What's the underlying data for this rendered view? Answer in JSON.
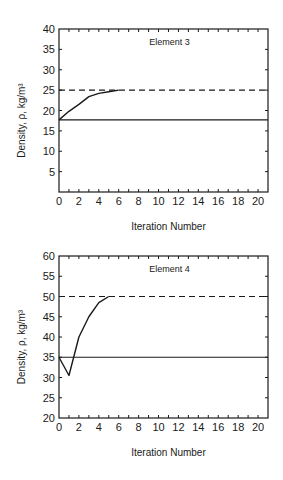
{
  "chart_data": [
    {
      "type": "line",
      "title": "Element 3",
      "xlabel": "Iteration Number",
      "ylabel": "Density, ρ, kg/m³",
      "xlim": [
        0,
        21
      ],
      "ylim": [
        0,
        40
      ],
      "xticks": [
        0,
        2,
        4,
        6,
        8,
        10,
        12,
        14,
        16,
        18,
        20
      ],
      "yticks": [
        5,
        10,
        15,
        20,
        25,
        30,
        35,
        40
      ],
      "grid": false,
      "series": [
        {
          "name": "iterated density",
          "style": "solid",
          "x": [
            0,
            1,
            2,
            3,
            4,
            5,
            6
          ],
          "y": [
            17.7,
            19.8,
            21.5,
            23.4,
            24.2,
            24.6,
            25.0
          ]
        },
        {
          "name": "initial density",
          "style": "solid",
          "x": [
            0,
            21
          ],
          "y": [
            17.7,
            17.7
          ]
        },
        {
          "name": "target density",
          "style": "dashed",
          "x": [
            0,
            21
          ],
          "y": [
            25.0,
            25.0
          ]
        }
      ]
    },
    {
      "type": "line",
      "title": "Element 4",
      "xlabel": "Iteration Number",
      "ylabel": "Density, ρ, kg/m³",
      "xlim": [
        0,
        21
      ],
      "ylim": [
        20,
        60
      ],
      "xticks": [
        0,
        2,
        4,
        6,
        8,
        10,
        12,
        14,
        16,
        18,
        20
      ],
      "yticks": [
        20,
        25,
        30,
        35,
        40,
        45,
        50,
        55,
        60
      ],
      "grid": false,
      "series": [
        {
          "name": "iterated density",
          "style": "solid",
          "x": [
            0,
            1,
            2,
            3,
            4,
            5
          ],
          "y": [
            35.0,
            30.5,
            40.0,
            45.0,
            48.5,
            50.0
          ]
        },
        {
          "name": "initial density",
          "style": "solid",
          "x": [
            0,
            21
          ],
          "y": [
            35.0,
            35.0
          ]
        },
        {
          "name": "target density",
          "style": "dashed",
          "x": [
            0,
            21
          ],
          "y": [
            50.0,
            50.0
          ]
        }
      ]
    }
  ]
}
